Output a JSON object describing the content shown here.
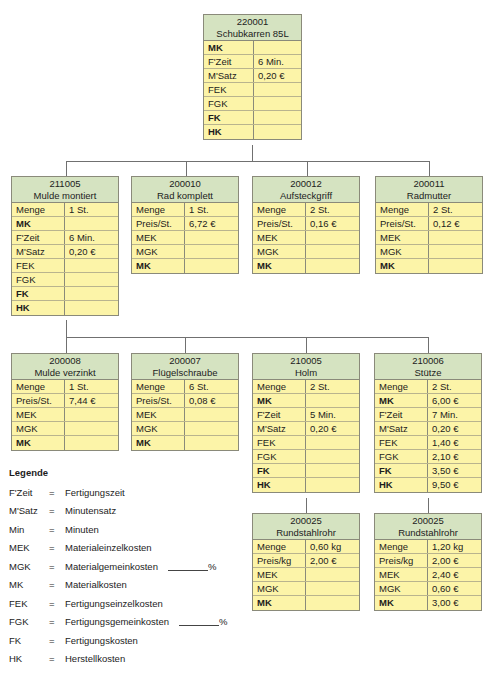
{
  "nodes": {
    "root": {
      "code": "220001",
      "name": "Schubkarren 85L",
      "rows": [
        {
          "k": "MK",
          "v": "",
          "b": true
        },
        {
          "k": "F'Zeit",
          "v": "6 Min."
        },
        {
          "k": "M'Satz",
          "v": "0,20 €"
        },
        {
          "k": "FEK",
          "v": ""
        },
        {
          "k": "FGK",
          "v": ""
        },
        {
          "k": "FK",
          "v": "",
          "b": true
        },
        {
          "k": "HK",
          "v": "",
          "b": true
        }
      ]
    },
    "mulde_montiert": {
      "code": "211005",
      "name": "Mulde montiert",
      "rows": [
        {
          "k": "Menge",
          "v": "1 St."
        },
        {
          "k": "MK",
          "v": "",
          "b": true
        },
        {
          "k": "F'Zeit",
          "v": "6 Min."
        },
        {
          "k": "M'Satz",
          "v": "0,20 €"
        },
        {
          "k": "FEK",
          "v": ""
        },
        {
          "k": "FGK",
          "v": ""
        },
        {
          "k": "FK",
          "v": "",
          "b": true
        },
        {
          "k": "HK",
          "v": "",
          "b": true
        }
      ]
    },
    "rad_komplett": {
      "code": "200010",
      "name": "Rad komplett",
      "rows": [
        {
          "k": "Menge",
          "v": "1 St."
        },
        {
          "k": "Preis/St.",
          "v": "6,72 €"
        },
        {
          "k": "MEK",
          "v": ""
        },
        {
          "k": "MGK",
          "v": ""
        },
        {
          "k": "MK",
          "v": "",
          "b": true
        }
      ]
    },
    "aufsteckgriff": {
      "code": "200012",
      "name": "Aufsteckgriff",
      "rows": [
        {
          "k": "Menge",
          "v": "2 St."
        },
        {
          "k": "Preis/St.",
          "v": "0,16 €"
        },
        {
          "k": "MEK",
          "v": ""
        },
        {
          "k": "MGK",
          "v": ""
        },
        {
          "k": "MK",
          "v": "",
          "b": true
        }
      ]
    },
    "radmutter": {
      "code": "200011",
      "name": "Radmutter",
      "rows": [
        {
          "k": "Menge",
          "v": "2 St."
        },
        {
          "k": "Preis/St.",
          "v": "0,12 €"
        },
        {
          "k": "MEK",
          "v": ""
        },
        {
          "k": "MGK",
          "v": ""
        },
        {
          "k": "MK",
          "v": "",
          "b": true
        }
      ]
    },
    "mulde_verzinkt": {
      "code": "200008",
      "name": "Mulde verzinkt",
      "rows": [
        {
          "k": "Menge",
          "v": "1 St."
        },
        {
          "k": "Preis/St.",
          "v": "7,44 €"
        },
        {
          "k": "MEK",
          "v": ""
        },
        {
          "k": "MGK",
          "v": ""
        },
        {
          "k": "MK",
          "v": "",
          "b": true
        }
      ]
    },
    "fluegelschraube": {
      "code": "200007",
      "name": "Flügelschraube",
      "rows": [
        {
          "k": "Menge",
          "v": "6 St."
        },
        {
          "k": "Preis/St.",
          "v": "0,08 €"
        },
        {
          "k": "MEK",
          "v": ""
        },
        {
          "k": "MGK",
          "v": ""
        },
        {
          "k": "MK",
          "v": "",
          "b": true
        }
      ]
    },
    "holm": {
      "code": "210005",
      "name": "Holm",
      "rows": [
        {
          "k": "Menge",
          "v": "2 St."
        },
        {
          "k": "MK",
          "v": "",
          "b": true
        },
        {
          "k": "F'Zeit",
          "v": "5 Min."
        },
        {
          "k": "M'Satz",
          "v": "0,20 €"
        },
        {
          "k": "FEK",
          "v": ""
        },
        {
          "k": "FGK",
          "v": ""
        },
        {
          "k": "FK",
          "v": "",
          "b": true
        },
        {
          "k": "HK",
          "v": "",
          "b": true
        }
      ]
    },
    "stuetze": {
      "code": "210006",
      "name": "Stütze",
      "rows": [
        {
          "k": "Menge",
          "v": "2 St."
        },
        {
          "k": "MK",
          "v": "6,00 €",
          "b": true
        },
        {
          "k": "F'Zeit",
          "v": "7 Min."
        },
        {
          "k": "M'Satz",
          "v": "0,20 €"
        },
        {
          "k": "FEK",
          "v": "1,40 €"
        },
        {
          "k": "FGK",
          "v": "2,10 €"
        },
        {
          "k": "FK",
          "v": "3,50 €",
          "b": true
        },
        {
          "k": "HK",
          "v": "9,50 €",
          "b": true
        }
      ]
    },
    "rundstahlrohr_1": {
      "code": "200025",
      "name": "Rundstahlrohr",
      "rows": [
        {
          "k": "Menge",
          "v": "0,60 kg"
        },
        {
          "k": "Preis/kg",
          "v": "2,00 €"
        },
        {
          "k": "MEK",
          "v": ""
        },
        {
          "k": "MGK",
          "v": ""
        },
        {
          "k": "MK",
          "v": "",
          "b": true
        }
      ]
    },
    "rundstahlrohr_2": {
      "code": "200025",
      "name": "Rundstahlrohr",
      "rows": [
        {
          "k": "Menge",
          "v": "1,20 kg"
        },
        {
          "k": "Preis/kg",
          "v": "2,00 €"
        },
        {
          "k": "MEK",
          "v": "2,40 €"
        },
        {
          "k": "MGK",
          "v": "0,60 €"
        },
        {
          "k": "MK",
          "v": "3,00 €",
          "b": true
        }
      ]
    }
  },
  "legend": {
    "title": "Legende",
    "items": [
      {
        "ab": "F'Zeit",
        "eq": "=",
        "text": "Fertigungszeit"
      },
      {
        "ab": "M'Satz",
        "eq": "=",
        "text": "Minutensatz"
      },
      {
        "ab": "Min",
        "eq": "=",
        "text": "Minuten"
      },
      {
        "ab": "MEK",
        "eq": "=",
        "text": "Materialeinzelkosten"
      },
      {
        "ab": "MGK",
        "eq": "=",
        "text": "Materialgemeinkosten",
        "pct": "%"
      },
      {
        "ab": "MK",
        "eq": "=",
        "text": "Materialkosten"
      },
      {
        "ab": "FEK",
        "eq": "=",
        "text": "Fertigungseinzelkosten"
      },
      {
        "ab": "FGK",
        "eq": "=",
        "text": "Fertigungsgemeinkosten",
        "pct": "%"
      },
      {
        "ab": "FK",
        "eq": "=",
        "text": "Fertigungskosten"
      },
      {
        "ab": "HK",
        "eq": "=",
        "text": "Herstellkosten"
      }
    ]
  },
  "colors": {
    "header": "#d5e3c1",
    "body": "#fcf4a8",
    "border": "#8a8a7a",
    "line": "#707070"
  }
}
